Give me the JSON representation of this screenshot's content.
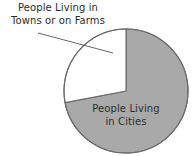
{
  "figure": {
    "background_color": "#ffffff",
    "width": 195,
    "height": 156
  },
  "callout": {
    "label": "People Living in\nTowns or on Farms",
    "line1": "People Living in",
    "line2": "Towns or on Farms",
    "text_color": "#2b2b2b",
    "leader_line_color": "#555555"
  },
  "slice_label": {
    "label": "People Living\nin Cities",
    "line1": "People Living",
    "line2": "in Cities",
    "text_color": "#2f2f2f"
  },
  "chart_data": {
    "type": "pie",
    "title": "",
    "subtitle": "",
    "xlabel": "",
    "ylabel": "",
    "legend_position": "callout-labels",
    "grid": false,
    "start_angle_deg": 90,
    "direction": "counterclockwise",
    "center": {
      "x": 126,
      "y": 91
    },
    "radius": 62,
    "labels": [
      "People Living in Cities",
      "People Living in Towns or on Farms"
    ],
    "values": [
      72,
      28
    ],
    "unit": "percent",
    "slices": [
      {
        "name": "People Living in Cities",
        "value": 72,
        "percent": 72,
        "angle_deg": 259.2,
        "color": "#a9a9a9",
        "stroke": "#6b6b6b",
        "label_position": "inside",
        "label_text": "People Living\nin Cities"
      },
      {
        "name": "People Living in Towns or on Farms",
        "value": 28,
        "percent": 28,
        "angle_deg": 100.8,
        "color": "#ffffff",
        "stroke": "#6b6b6b",
        "label_position": "callout",
        "label_text": "People Living in\nTowns or on Farms"
      }
    ]
  },
  "colors": {
    "cities_fill": "#a9a9a9",
    "towns_farms_fill": "#ffffff",
    "outline": "#6b6b6b",
    "text": "#2b2b2b",
    "background": "#ffffff"
  }
}
